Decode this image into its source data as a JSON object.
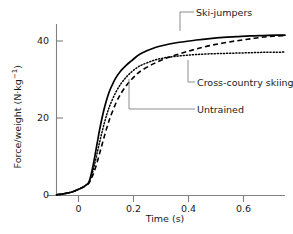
{
  "chart_data": {
    "type": "line",
    "title": "",
    "xlabel": "Time (s)",
    "ylabel": "Force/weight (N·kg⁻¹)",
    "xlim": [
      -0.12,
      0.73
    ],
    "ylim": [
      0,
      46
    ],
    "xticks": [
      0,
      0.2,
      0.4,
      0.6
    ],
    "xtick_labels": [
      "0",
      "0.2",
      "0.4",
      "0.6"
    ],
    "yticks": [
      0,
      20,
      40
    ],
    "ytick_labels": [
      "0",
      "20",
      "40"
    ],
    "grid": false,
    "legend_position": "annotations-right",
    "series": [
      {
        "name": "Ski-jumpers",
        "style": "solid",
        "color": "#000000",
        "x": [
          -0.12,
          -0.09,
          -0.06,
          -0.04,
          -0.02,
          -0.01,
          0.0,
          0.01,
          0.02,
          0.03,
          0.04,
          0.05,
          0.06,
          0.07,
          0.08,
          0.1,
          0.12,
          0.14,
          0.16,
          0.18,
          0.2,
          0.24,
          0.28,
          0.32,
          0.36,
          0.4,
          0.45,
          0.5,
          0.55,
          0.6,
          0.65,
          0.7,
          0.73
        ],
        "y": [
          0.2,
          0.5,
          1.0,
          1.6,
          2.3,
          2.8,
          3.5,
          6.0,
          9.5,
          13.5,
          17.5,
          21.0,
          24.0,
          26.5,
          28.5,
          31.5,
          33.5,
          35.0,
          36.2,
          37.4,
          38.3,
          39.5,
          40.3,
          40.9,
          41.3,
          41.7,
          42.1,
          42.4,
          42.6,
          42.8,
          42.9,
          43.0,
          43.0
        ]
      },
      {
        "name": "Cross-country skiing",
        "style": "dotted",
        "color": "#000000",
        "x": [
          -0.12,
          -0.09,
          -0.06,
          -0.04,
          -0.02,
          -0.01,
          0.0,
          0.01,
          0.02,
          0.03,
          0.04,
          0.05,
          0.06,
          0.07,
          0.08,
          0.1,
          0.12,
          0.14,
          0.16,
          0.18,
          0.2,
          0.24,
          0.28,
          0.32,
          0.36,
          0.4,
          0.45,
          0.5,
          0.55,
          0.6,
          0.65,
          0.7,
          0.73
        ],
        "y": [
          0.2,
          0.5,
          1.0,
          1.6,
          2.3,
          2.8,
          3.4,
          5.2,
          7.8,
          11.0,
          14.2,
          17.2,
          20.0,
          22.4,
          24.4,
          27.6,
          30.0,
          31.8,
          33.2,
          34.3,
          35.1,
          36.2,
          36.9,
          37.3,
          37.6,
          37.8,
          38.0,
          38.1,
          38.2,
          38.3,
          38.4,
          38.4,
          38.5
        ]
      },
      {
        "name": "Untrained",
        "style": "dashed",
        "color": "#000000",
        "x": [
          -0.12,
          -0.09,
          -0.06,
          -0.04,
          -0.02,
          -0.01,
          0.0,
          0.01,
          0.02,
          0.03,
          0.04,
          0.05,
          0.06,
          0.07,
          0.08,
          0.1,
          0.12,
          0.14,
          0.16,
          0.18,
          0.2,
          0.24,
          0.28,
          0.32,
          0.36,
          0.4,
          0.45,
          0.5,
          0.55,
          0.6,
          0.65,
          0.7,
          0.73
        ],
        "y": [
          0.2,
          0.5,
          1.0,
          1.6,
          2.3,
          2.8,
          3.3,
          4.6,
          6.4,
          8.6,
          11.2,
          13.8,
          16.4,
          18.8,
          21.0,
          24.6,
          27.4,
          29.5,
          31.2,
          32.6,
          33.7,
          35.3,
          36.6,
          37.6,
          38.5,
          39.3,
          40.2,
          40.9,
          41.5,
          42.0,
          42.5,
          42.8,
          42.9
        ]
      }
    ],
    "annotations": [
      {
        "text": "Ski-jumpers",
        "target_series": "Ski-jumpers"
      },
      {
        "text": "Cross-country skiing",
        "target_series": "Cross-country skiing"
      },
      {
        "text": "Untrained",
        "target_series": "Untrained"
      }
    ]
  },
  "axes": {
    "x_title": "Time (s)",
    "y_title_parts": {
      "main": "Force/weight (N·kg",
      "exponent": "−1",
      "tail": ")"
    },
    "xticks": [
      "0",
      "0.2",
      "0.4",
      "0.6"
    ],
    "yticks": [
      "40",
      "20",
      "0"
    ]
  },
  "labels": {
    "ski_jumpers": "Ski-jumpers",
    "cross_country": "Cross-country skiing",
    "untrained": "Untrained"
  },
  "colors": {
    "line": "#000000",
    "axis": "#808080",
    "leader": "#808080",
    "text": "#1a1a1a"
  }
}
